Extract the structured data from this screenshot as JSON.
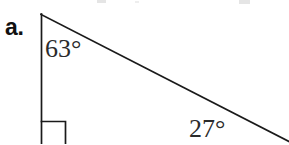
{
  "document": {
    "item_label": "a.",
    "background_color": "#ffffff",
    "ink_color": "#1a1a1a"
  },
  "figure": {
    "name": "right-triangle",
    "stroke_color": "#1a1a1a",
    "stroke_width": 1.6,
    "apex": {
      "x": 41,
      "y": 14
    },
    "vertical_leg": {
      "x1": 41,
      "y1": 14,
      "x2": 41,
      "y2": 144
    },
    "hypotenuse": {
      "x1": 41,
      "y1": 14,
      "x2": 289,
      "y2": 141
    },
    "right_angle_marker": {
      "corner_x": 41,
      "corner_y": 121,
      "size": 25
    }
  },
  "labels": {
    "angle_top": "63°",
    "angle_bottom": "27°"
  },
  "artifacts": {
    "top_edge_specks": [
      {
        "x": 97,
        "y": 0,
        "w": 9,
        "h": 3
      },
      {
        "x": 239,
        "y": 0,
        "w": 11,
        "h": 4
      },
      {
        "x": 135,
        "y": 1,
        "w": 4,
        "h": 2
      }
    ]
  }
}
